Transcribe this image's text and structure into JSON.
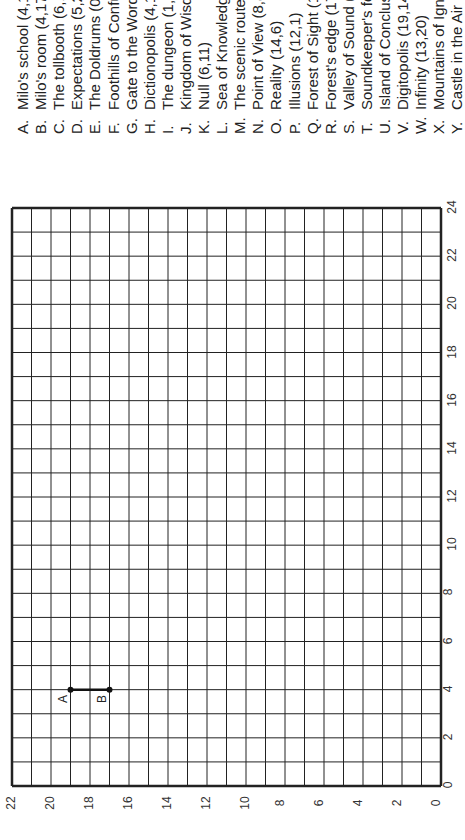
{
  "legend": [
    {
      "letter": "A.",
      "text": "Milo's school (4,19)"
    },
    {
      "letter": "B.",
      "text": "Milo's room (4,17)"
    },
    {
      "letter": "C.",
      "text": "The tollbooth (6,17)"
    },
    {
      "letter": "D.",
      "text": "Expectations (5,22)"
    },
    {
      "letter": "E.",
      "text": "The Doldrums (0,18)"
    },
    {
      "letter": "F.",
      "text": "Foothills of Confusion"
    },
    {
      "letter": "G.",
      "text": "Gate to the Word Market"
    },
    {
      "letter": "H.",
      "text": "Dictionopolis (4,11)"
    },
    {
      "letter": "I.",
      "text": "The dungeon (1,3)"
    },
    {
      "letter": "J.",
      "text": "Kingdom of Wisdom"
    },
    {
      "letter": "K.",
      "text": "Null (6,11)"
    },
    {
      "letter": "L.",
      "text": "Sea of Knowledge"
    },
    {
      "letter": "M.",
      "text": "The scenic route (7"
    },
    {
      "letter": "N.",
      "text": "Point of View (8,8)"
    },
    {
      "letter": "O.",
      "text": "Reality (14,6)"
    },
    {
      "letter": "P.",
      "text": "Illusions (12,1)"
    },
    {
      "letter": "Q.",
      "text": "Forest of Sight (15,"
    },
    {
      "letter": "R.",
      "text": "Forest's edge (17,6"
    },
    {
      "letter": "S.",
      "text": "Valley of Sound (16"
    },
    {
      "letter": "T.",
      "text": "Soundkeeper's fort"
    },
    {
      "letter": "U.",
      "text": "Island of Conclusions"
    },
    {
      "letter": "V.",
      "text": "Digitopolis (19,14)"
    },
    {
      "letter": "W.",
      "text": "Infinity (13,20)"
    },
    {
      "letter": "X.",
      "text": "Mountains of Ignorance"
    },
    {
      "letter": "Y.",
      "text": "Castle in the Air (5,"
    }
  ],
  "grid": {
    "x_axis_ticks": [
      "0",
      "2",
      "4",
      "6",
      "8",
      "10",
      "12",
      "14",
      "16",
      "18",
      "20",
      "22",
      "24"
    ],
    "y_axis_ticks": [
      "0",
      "2",
      "4",
      "6",
      "8",
      "10",
      "12",
      "14",
      "16",
      "18",
      "20",
      "22"
    ],
    "x_max": 24,
    "y_max": 22
  },
  "plotted": {
    "points": [
      {
        "label": "A",
        "x": 4,
        "y": 19
      },
      {
        "label": "B",
        "x": 4,
        "y": 17
      }
    ],
    "segment": [
      "A",
      "B"
    ]
  }
}
